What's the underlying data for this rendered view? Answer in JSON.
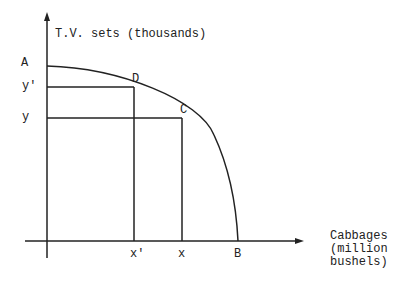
{
  "diagram": {
    "type": "production-possibility-frontier",
    "y_axis_label": "T.V. sets (thousands)",
    "x_axis_label_lines": [
      "Cabbages",
      "(million",
      "bushels)"
    ],
    "points": {
      "A": "A",
      "B": "B",
      "C": "C",
      "D": "D"
    },
    "y_ticks": {
      "y_prime": "y'",
      "y": "y"
    },
    "x_ticks": {
      "x_prime": "x'",
      "x": "x"
    },
    "colors": {
      "line": "#222222",
      "background": "#ffffff"
    }
  }
}
